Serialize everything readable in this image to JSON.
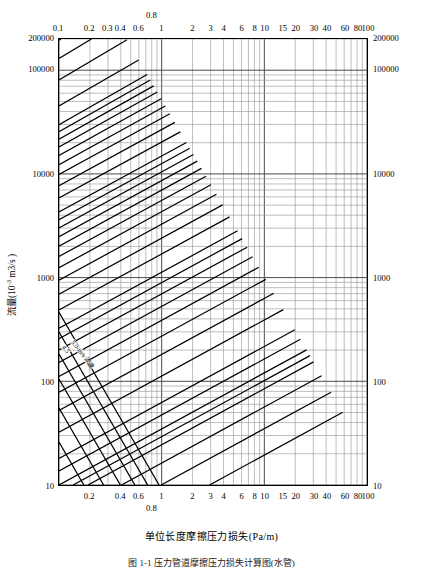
{
  "figure": {
    "caption": "图 1-1  压力管道摩擦压力损失计算图(水管)",
    "x_axis_title": "单位长度摩擦压力损失(Pa/m)",
    "y_axis_title_main": "流量(10",
    "y_axis_title_exp": "-3",
    "y_axis_title_tail": " m3/s )"
  },
  "chart_data": {
    "type": "line",
    "title": "压力管道摩擦压力损失计算图",
    "xlabel": "单位长度摩擦压力损失(Pa/m)",
    "ylabel": "流量(10^-3 m^3/s)",
    "xscale": "log",
    "yscale": "log",
    "xlim": [
      0.1,
      100
    ],
    "ylim": [
      10,
      200000
    ],
    "grid": true,
    "legend": "none",
    "x_ticks_top": [
      {
        "label": "0.1",
        "value": 0.1
      },
      {
        "label": "0.2",
        "value": 0.2
      },
      {
        "label": "0.3",
        "value": 0.3
      },
      {
        "label": "0.4",
        "value": 0.4
      },
      {
        "label": "0.6",
        "value": 0.6
      },
      {
        "label": "0.8",
        "value": 0.8
      },
      {
        "label": "1",
        "value": 1
      },
      {
        "label": "2",
        "value": 2
      },
      {
        "label": "3",
        "value": 3
      },
      {
        "label": "4",
        "value": 4
      },
      {
        "label": "6",
        "value": 6
      },
      {
        "label": "8",
        "value": 8
      },
      {
        "label": "10",
        "value": 10
      },
      {
        "label": "15",
        "value": 15
      },
      {
        "label": "20",
        "value": 20
      },
      {
        "label": "30",
        "value": 30
      },
      {
        "label": "40",
        "value": 40
      },
      {
        "label": "60",
        "value": 60
      },
      {
        "label": "80",
        "value": 80
      },
      {
        "label": "100",
        "value": 100
      }
    ],
    "x_ticks_bottom": [
      {
        "label": "0.2",
        "value": 0.2
      },
      {
        "label": "0.4",
        "value": 0.4
      },
      {
        "label": "0.6",
        "value": 0.6
      },
      {
        "label": "0.8",
        "value": 0.8
      },
      {
        "label": "1",
        "value": 1
      },
      {
        "label": "2",
        "value": 2
      },
      {
        "label": "3",
        "value": 3
      },
      {
        "label": "4",
        "value": 4
      },
      {
        "label": "6",
        "value": 6
      },
      {
        "label": "8",
        "value": 8
      },
      {
        "label": "10",
        "value": 10
      },
      {
        "label": "15",
        "value": 15
      },
      {
        "label": "20",
        "value": 20
      },
      {
        "label": "30",
        "value": 30
      },
      {
        "label": "40",
        "value": 40
      },
      {
        "label": "60",
        "value": 60
      },
      {
        "label": "80",
        "value": 80
      },
      {
        "label": "100",
        "value": 100
      }
    ],
    "y_ticks_left": [
      {
        "label": "200000",
        "value": 200000
      },
      {
        "label": "100000",
        "value": 100000
      },
      {
        "label": "10000",
        "value": 10000
      },
      {
        "label": "1000",
        "value": 1000
      },
      {
        "label": "100",
        "value": 100
      },
      {
        "label": "10",
        "value": 10
      }
    ],
    "y_ticks_right": [
      {
        "label": "200000",
        "value": 200000
      },
      {
        "label": "100000",
        "value": 100000
      },
      {
        "label": "10000",
        "value": 10000
      },
      {
        "label": "1000",
        "value": 1000
      },
      {
        "label": "100",
        "value": 100
      },
      {
        "label": "10",
        "value": 10
      }
    ],
    "series_families": [
      {
        "name": "pipe-diameter",
        "unit_label": "mm",
        "annotation": "管径",
        "title_labels": [
          "2000-mm 管径",
          "75-mm 管径"
        ],
        "values": [
          4500,
          4000,
          3500,
          3000,
          2500,
          2000,
          1700,
          1600,
          1500,
          1400,
          1300,
          1200,
          1100,
          1000,
          900,
          800,
          750,
          700,
          650,
          600,
          550,
          500,
          450,
          400,
          350,
          300,
          275,
          250,
          225,
          200,
          175,
          150,
          125,
          100,
          90,
          80,
          75,
          70,
          60,
          50,
          40
        ]
      },
      {
        "name": "velocity",
        "unit_label": "m/s",
        "annotation": "流速",
        "title_labels": [
          "5.0-m/s 流速",
          "3.5-m/s 流速"
        ],
        "values": [
          0.1,
          0.2,
          0.4,
          0.6,
          0.8,
          1.0,
          1.2,
          1.5,
          2.0,
          2.5,
          3.0,
          3.5,
          4.0,
          4.5,
          5.0
        ]
      }
    ]
  }
}
